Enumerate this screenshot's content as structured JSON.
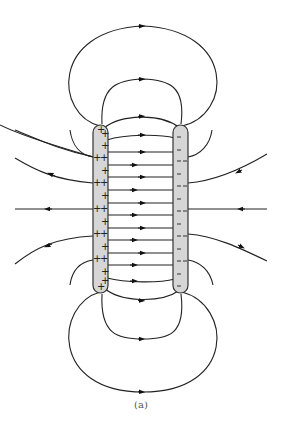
{
  "figure": {
    "caption": "(a)",
    "left_plate": {
      "charge": "positive",
      "symbol": "+",
      "fill": "#d6d6d6"
    },
    "right_plate": {
      "charge": "negative",
      "symbol": "–",
      "fill": "#d6d6d6"
    },
    "line_color": "#222222",
    "interior_field_lines": 13,
    "exterior_left_lines": 4,
    "exterior_right_lines": 4,
    "top_loops": 3,
    "bottom_loops": 3,
    "arrow_direction": "positive to negative"
  }
}
